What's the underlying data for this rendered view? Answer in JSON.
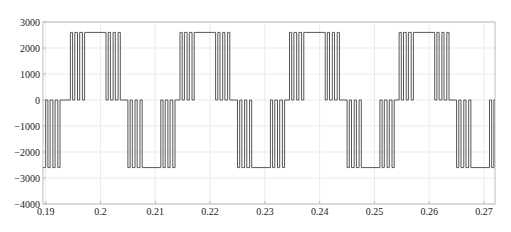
{
  "chart_data": {
    "type": "line",
    "title": "",
    "xlabel": "",
    "ylabel": "",
    "xlim": [
      0.1895,
      0.272
    ],
    "ylim": [
      -4000,
      3000
    ],
    "grid": true,
    "legend": null,
    "xticks": [
      0.19,
      0.2,
      0.21,
      0.22,
      0.23,
      0.24,
      0.25,
      0.26,
      0.27
    ],
    "xtick_labels": [
      "0.19",
      "0.2",
      "0.21",
      "0.22",
      "0.23",
      "0.24",
      "0.25",
      "0.26",
      "0.27"
    ],
    "yticks": [
      3000,
      2000,
      1000,
      0,
      -1000,
      -2000,
      -3000,
      -4000
    ],
    "ytick_labels": [
      "3000",
      "2000",
      "1000",
      "0",
      "-1000",
      "-2000",
      "-3000",
      "-4000"
    ],
    "series": [
      {
        "name": "three-level PWM voltage",
        "levels": [
          -2600,
          0,
          2600
        ],
        "fundamental_period": 0.02,
        "first_positive_half_start": 0.1945,
        "switching_edges_per_transition": 4,
        "color": "#555555"
      }
    ]
  },
  "colors": {
    "line": "#555555",
    "grid": "#e6e6e6",
    "axis": "#bbbbbb"
  }
}
